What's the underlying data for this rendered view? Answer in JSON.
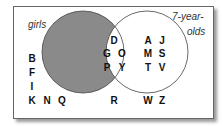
{
  "diagram": {
    "type": "venn",
    "sets": [
      {
        "label": "girls",
        "shaded_region": "girls only"
      },
      {
        "label_line1": "7-year-",
        "label_line2": "olds"
      }
    ],
    "regions": {
      "girls_only": [],
      "both": [
        "D",
        "G",
        "O",
        "P",
        "Y"
      ],
      "seven_year_olds_only": [
        "A",
        "J",
        "M",
        "S",
        "T",
        "V"
      ],
      "outside": [
        "B",
        "F",
        "I",
        "K",
        "N",
        "Q",
        "R",
        "W",
        "Z"
      ]
    },
    "colors": {
      "shade": "#8a8a8a",
      "outline": "#444444",
      "frame": "#666666"
    }
  }
}
